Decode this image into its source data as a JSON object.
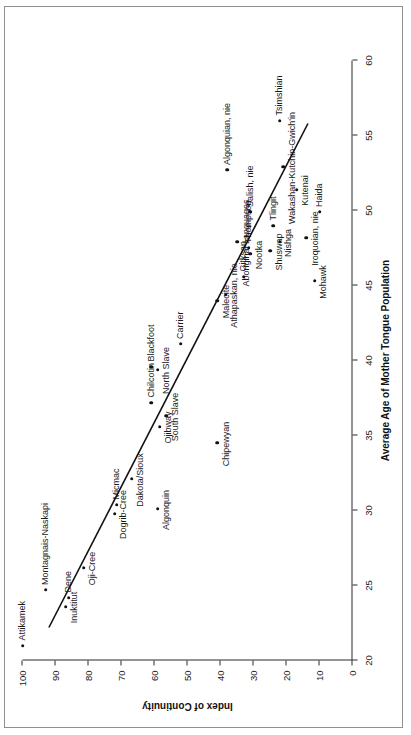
{
  "figure": {
    "x_title": "Average Age of Mother Tongue Population",
    "y_title": "Index of Continuity"
  },
  "chart_data": {
    "type": "scatter",
    "title": "",
    "xlabel": "Average Age of Mother Tongue Population",
    "ylabel": "Index of Continuity",
    "xlim": [
      20,
      60
    ],
    "ylim": [
      0,
      100
    ],
    "xticks": [
      20,
      25,
      30,
      35,
      40,
      45,
      50,
      55,
      60
    ],
    "yticks": [
      0,
      10,
      20,
      30,
      40,
      50,
      60,
      70,
      80,
      90,
      100
    ],
    "grid": false,
    "legend": null,
    "trendline": {
      "name": "linear fit",
      "x": [
        22.2,
        55.8
      ],
      "y": [
        92.0,
        13.5
      ]
    },
    "points": [
      {
        "label": "Attikamek",
        "x": 21.0,
        "y": 100.0,
        "label_pos": "right"
      },
      {
        "label": "Montagnais-Naskapi",
        "x": 24.7,
        "y": 93.0,
        "label_pos": "right"
      },
      {
        "label": "Inuktitut",
        "x": 23.6,
        "y": 87.0,
        "label_pos": "below"
      },
      {
        "label": "Dene",
        "x": 24.2,
        "y": 86.0,
        "label_pos": "right"
      },
      {
        "label": "Oji-Cree",
        "x": 26.2,
        "y": 81.5,
        "label_pos": "below"
      },
      {
        "label": "Dogrib-Cree",
        "x": 29.8,
        "y": 72.0,
        "label_pos": "below"
      },
      {
        "label": "Micmac",
        "x": 30.4,
        "y": 71.5,
        "label_pos": "right"
      },
      {
        "label": "Dakota/Sioux",
        "x": 32.1,
        "y": 67.0,
        "label_pos": "below"
      },
      {
        "label": "Chilcotin",
        "x": 37.2,
        "y": 61.0,
        "label_pos": "right"
      },
      {
        "label": "Blackfoot",
        "x": 39.6,
        "y": 61.0,
        "label_pos": "right"
      },
      {
        "label": "North Slave",
        "x": 39.4,
        "y": 59.0,
        "label_pos": "below"
      },
      {
        "label": "Ojibway",
        "x": 35.6,
        "y": 58.5,
        "label_pos": "below"
      },
      {
        "label": "South Slave",
        "x": 36.3,
        "y": 56.5,
        "label_pos": "below"
      },
      {
        "label": "Algonquin",
        "x": 30.1,
        "y": 59.0,
        "label_pos": "below"
      },
      {
        "label": "Carrier",
        "x": 41.1,
        "y": 52.0,
        "label_pos": "right"
      },
      {
        "label": "Chipewyan",
        "x": 34.5,
        "y": 41.0,
        "label_pos": "below"
      },
      {
        "label": "Malecite",
        "x": 44.0,
        "y": 41.0,
        "label_pos": "below"
      },
      {
        "label": "Athapaskan, nie",
        "x": 44.4,
        "y": 38.5,
        "label_pos": "below"
      },
      {
        "label": "Gitksan",
        "x": 45.6,
        "y": 33.0,
        "label_pos": "right"
      },
      {
        "label": "Nootka",
        "x": 47.1,
        "y": 31.0,
        "label_pos": "below"
      },
      {
        "label": "Thompson",
        "x": 47.5,
        "y": 31.5,
        "label_pos": "right"
      },
      {
        "label": "Aboriginal Languages",
        "x": 47.9,
        "y": 35.0,
        "label_pos": "below"
      },
      {
        "label": "Salish, nie",
        "x": 49.9,
        "y": 31.0,
        "label_pos": "right"
      },
      {
        "label": "Shuswap",
        "x": 47.3,
        "y": 25.0,
        "label_pos": "below"
      },
      {
        "label": "Tlingit",
        "x": 49.0,
        "y": 24.0,
        "label_pos": "right"
      },
      {
        "label": "Nishga",
        "x": 47.9,
        "y": 22.0,
        "label_pos": "below"
      },
      {
        "label": "Wakashan-Kutchin-Gwich'in",
        "x": 52.9,
        "y": 21.0,
        "label_pos": "below"
      },
      {
        "label": "Tsimshian",
        "x": 56.0,
        "y": 22.0,
        "label_pos": "right"
      },
      {
        "label": "Kutenai",
        "x": 51.4,
        "y": 17.0,
        "label_pos": "below"
      },
      {
        "label": "Iroquoian, nie",
        "x": 48.2,
        "y": 14.0,
        "label_pos": "below"
      },
      {
        "label": "Algonquian, nie",
        "x": 52.7,
        "y": 38.0,
        "label_pos": "right"
      },
      {
        "label": "Haida",
        "x": 49.9,
        "y": 10.0,
        "label_pos": "right"
      },
      {
        "label": "Mohawk",
        "x": 45.3,
        "y": 11.5,
        "label_pos": "below"
      }
    ]
  }
}
